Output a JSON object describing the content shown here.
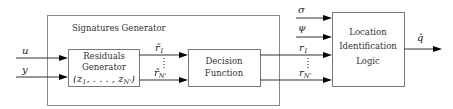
{
  "diagram": {
    "outer_block": {
      "title": "Signatures Generator"
    },
    "blocks": {
      "residuals_generator": {
        "lines": [
          "Residuals",
          "Generator"
        ],
        "math": "(z",
        "math_sub1": "1",
        "math_mid": ", . . . , z",
        "math_subN": "N'",
        "math_close": ")"
      },
      "decision_function": {
        "lines": [
          "Decision",
          "Function"
        ]
      },
      "location_logic": {
        "lines": [
          "Location",
          "Identification",
          "Logic"
        ]
      }
    },
    "signals": {
      "u": "u",
      "y": "y",
      "r_tilde_1": {
        "base": "r̃",
        "sub": "1"
      },
      "r_tilde_N": {
        "base": "r̃",
        "sub": "N'"
      },
      "sigma": "σ",
      "psi": "ψ",
      "r_1": {
        "base": "r",
        "sub": "1"
      },
      "r_N": {
        "base": "r",
        "sub": "N'"
      },
      "q_hat": "q̂"
    }
  }
}
